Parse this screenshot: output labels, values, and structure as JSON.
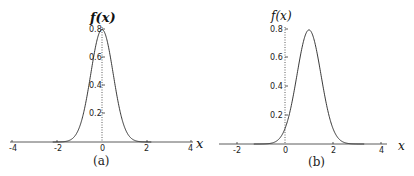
{
  "chart_data": [
    {
      "type": "line",
      "panel": "(a)",
      "title": "",
      "xlabel": "x",
      "ylabel": "f(x)",
      "xlim": [
        -4,
        4
      ],
      "ylim": [
        0,
        0.8
      ],
      "x_ticks": [
        "-4",
        "-2",
        "0",
        "2",
        "4"
      ],
      "y_ticks": [
        "0.2",
        "0.4",
        "0.6",
        "0.8"
      ],
      "grid": false,
      "series": [
        {
          "name": "f(x)",
          "distribution": "normal",
          "mean": 0,
          "sd": 0.5,
          "peak": 0.8,
          "x": [
            -4,
            -2,
            -1.5,
            -1,
            -0.5,
            0,
            0.5,
            1,
            1.5,
            2,
            4
          ],
          "y": [
            0,
            0.0003,
            0.009,
            0.108,
            0.484,
            0.798,
            0.484,
            0.108,
            0.009,
            0.0003,
            0
          ]
        }
      ]
    },
    {
      "type": "line",
      "panel": "(b)",
      "title": "",
      "xlabel": "x",
      "ylabel": "f(x)",
      "xlim": [
        -2.7,
        4.5
      ],
      "ylim": [
        0,
        0.8
      ],
      "x_ticks": [
        "-2",
        "0",
        "2",
        "4"
      ],
      "y_ticks": [
        "0.2",
        "0.4",
        "0.6",
        "0.8"
      ],
      "grid": false,
      "series": [
        {
          "name": "f(x)",
          "distribution": "normal",
          "mean": 1,
          "sd": 0.5,
          "peak": 0.8,
          "x": [
            -1,
            -0.5,
            0,
            0.5,
            1,
            1.5,
            2,
            2.5,
            3
          ],
          "y": [
            0.0003,
            0.009,
            0.108,
            0.484,
            0.798,
            0.484,
            0.108,
            0.009,
            0.0003
          ]
        }
      ]
    }
  ],
  "panels": {
    "a": {
      "caption": "(a)",
      "ylabel": "f(x)",
      "xlabel": "x",
      "xticks": [
        "-4",
        "-2",
        "0",
        "2",
        "4"
      ],
      "yticks": [
        "0.2",
        "0.4",
        "0.6",
        "0.8"
      ]
    },
    "b": {
      "caption": "(b)",
      "ylabel": "f(x)",
      "xlabel": "x",
      "xticks": [
        "-2",
        "0",
        "2",
        "4"
      ],
      "yticks": [
        "0.2",
        "0.4",
        "0.6",
        "0.8"
      ]
    }
  }
}
